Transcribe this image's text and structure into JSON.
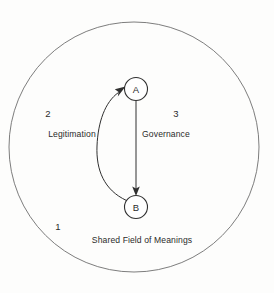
{
  "figure": {
    "title": "Shared Field of Meanings",
    "background_color": "#fdfdfc",
    "boundary": {
      "name": "shared-field-boundary",
      "stroke_color": "#6e6e6e",
      "center_x": 134,
      "center_y": 147,
      "radius": 125
    },
    "nodes": [
      {
        "id": "A",
        "label": "A",
        "cx": 136,
        "cy": 89,
        "r": 11.5
      },
      {
        "id": "B",
        "label": "B",
        "cx": 136,
        "cy": 207,
        "r": 11.5
      }
    ],
    "edges": [
      {
        "id": "governance",
        "label": "Governance",
        "from": "A",
        "to": "B",
        "shape": "straight",
        "label_x": 166,
        "label_y": 134
      },
      {
        "id": "legitimation",
        "label": "Legitimation",
        "from": "B",
        "to": "A",
        "shape": "curved-left",
        "label_x": 72,
        "label_y": 134
      }
    ],
    "zones": [
      {
        "number": "1",
        "caption": "Shared Field of Meanings",
        "number_x": 58,
        "number_y": 230,
        "caption_x": 142,
        "caption_y": 243
      },
      {
        "number": "2",
        "caption": "Legitimation",
        "number_x": 48,
        "number_y": 117,
        "caption_x": 72,
        "caption_y": 137
      },
      {
        "number": "3",
        "caption": "Governance",
        "number_x": 176,
        "number_y": 117,
        "caption_x": 166,
        "caption_y": 137
      }
    ],
    "colors": {
      "ink": "#303030",
      "boundary": "#6e6e6e",
      "text": "#2b2b2b"
    }
  }
}
